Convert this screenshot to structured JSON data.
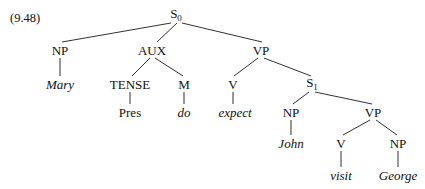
{
  "figure": {
    "example_number": "(9.48)",
    "type": "syntax-tree",
    "sentence": "Mary does expect John to visit George",
    "line_color": "#1a1a1a",
    "text_color": "#111111",
    "background_color": "#ffffff"
  },
  "nodes": [
    {
      "id": "s0",
      "label": "S",
      "subscript": "0",
      "style": "cat",
      "x": 176,
      "y": 15
    },
    {
      "id": "np_subj",
      "label": "NP",
      "subscript": "",
      "style": "cat",
      "x": 60,
      "y": 50
    },
    {
      "id": "aux",
      "label": "AUX",
      "subscript": "",
      "style": "cat",
      "x": 152,
      "y": 50
    },
    {
      "id": "vp_main",
      "label": "VP",
      "subscript": "",
      "style": "cat",
      "x": 261,
      "y": 50
    },
    {
      "id": "mary",
      "label": "Mary",
      "subscript": "",
      "style": "terminal",
      "x": 60,
      "y": 84
    },
    {
      "id": "tense",
      "label": "TENSE",
      "subscript": "",
      "style": "cat",
      "x": 130,
      "y": 84
    },
    {
      "id": "m",
      "label": "M",
      "subscript": "",
      "style": "cat",
      "x": 184,
      "y": 84
    },
    {
      "id": "v_main",
      "label": "V",
      "subscript": "",
      "style": "cat",
      "x": 233,
      "y": 84
    },
    {
      "id": "s1",
      "label": "S",
      "subscript": "1",
      "style": "cat",
      "x": 312,
      "y": 84
    },
    {
      "id": "pres",
      "label": "Pres",
      "subscript": "",
      "style": "plain",
      "x": 130,
      "y": 112
    },
    {
      "id": "do",
      "label": "do",
      "subscript": "",
      "style": "terminal",
      "x": 184,
      "y": 112
    },
    {
      "id": "expect",
      "label": "expect",
      "subscript": "",
      "style": "terminal",
      "x": 235,
      "y": 112
    },
    {
      "id": "np_emb",
      "label": "NP",
      "subscript": "",
      "style": "cat",
      "x": 291,
      "y": 112
    },
    {
      "id": "vp_emb",
      "label": "VP",
      "subscript": "",
      "style": "cat",
      "x": 373,
      "y": 112
    },
    {
      "id": "john",
      "label": "John",
      "subscript": "",
      "style": "terminal",
      "x": 291,
      "y": 143
    },
    {
      "id": "v_emb",
      "label": "V",
      "subscript": "",
      "style": "cat",
      "x": 341,
      "y": 143
    },
    {
      "id": "np_obj",
      "label": "NP",
      "subscript": "",
      "style": "cat",
      "x": 398,
      "y": 143
    },
    {
      "id": "visit",
      "label": "visit",
      "subscript": "",
      "style": "terminal",
      "x": 341,
      "y": 175
    },
    {
      "id": "george",
      "label": "George",
      "subscript": "",
      "style": "terminal",
      "x": 398,
      "y": 175
    }
  ],
  "edges": [
    {
      "from": "s0",
      "to": "np_subj",
      "x1": 171,
      "y1": 23,
      "x2": 62,
      "y2": 42
    },
    {
      "from": "s0",
      "to": "aux",
      "x1": 177,
      "y1": 23,
      "x2": 157,
      "y2": 42
    },
    {
      "from": "s0",
      "to": "vp_main",
      "x1": 182,
      "y1": 23,
      "x2": 262,
      "y2": 42
    },
    {
      "from": "np_subj",
      "to": "mary",
      "x1": 60,
      "y1": 58,
      "x2": 60,
      "y2": 76
    },
    {
      "from": "aux",
      "to": "tense",
      "x1": 150,
      "y1": 58,
      "x2": 132,
      "y2": 76
    },
    {
      "from": "aux",
      "to": "m",
      "x1": 155,
      "y1": 58,
      "x2": 183,
      "y2": 76
    },
    {
      "from": "vp_main",
      "to": "v_main",
      "x1": 258,
      "y1": 58,
      "x2": 234,
      "y2": 76
    },
    {
      "from": "vp_main",
      "to": "s1",
      "x1": 264,
      "y1": 58,
      "x2": 311,
      "y2": 76
    },
    {
      "from": "tense",
      "to": "pres",
      "x1": 130,
      "y1": 92,
      "x2": 130,
      "y2": 104
    },
    {
      "from": "m",
      "to": "do",
      "x1": 184,
      "y1": 92,
      "x2": 184,
      "y2": 104
    },
    {
      "from": "v_main",
      "to": "expect",
      "x1": 233,
      "y1": 92,
      "x2": 233,
      "y2": 104
    },
    {
      "from": "s1",
      "to": "np_emb",
      "x1": 309,
      "y1": 92,
      "x2": 293,
      "y2": 104
    },
    {
      "from": "s1",
      "to": "vp_emb",
      "x1": 315,
      "y1": 92,
      "x2": 372,
      "y2": 104
    },
    {
      "from": "np_emb",
      "to": "john",
      "x1": 291,
      "y1": 120,
      "x2": 291,
      "y2": 135
    },
    {
      "from": "vp_emb",
      "to": "v_emb",
      "x1": 370,
      "y1": 120,
      "x2": 343,
      "y2": 135
    },
    {
      "from": "vp_emb",
      "to": "np_obj",
      "x1": 376,
      "y1": 120,
      "x2": 397,
      "y2": 135
    },
    {
      "from": "v_emb",
      "to": "visit",
      "x1": 341,
      "y1": 151,
      "x2": 341,
      "y2": 167
    },
    {
      "from": "np_obj",
      "to": "george",
      "x1": 398,
      "y1": 151,
      "x2": 398,
      "y2": 167
    }
  ]
}
